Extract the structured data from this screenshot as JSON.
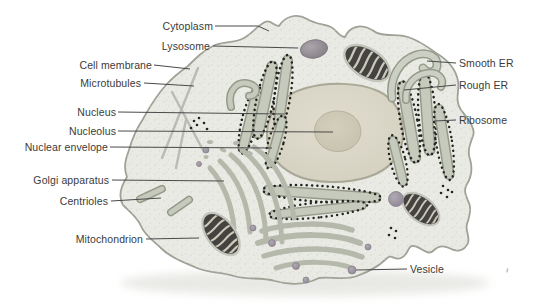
{
  "diagram": {
    "labels": {
      "cytoplasm": "Cytoplasm",
      "lysosome": "Lysosome",
      "cell_membrane": "Cell membrane",
      "microtubules": "Microtubules",
      "nucleus": "Nucleus",
      "nucleolus": "Nucleolus",
      "nuclear_envelope": "Nuclear envelope",
      "golgi_apparatus": "Golgi apparatus",
      "centrioles": "Centrioles",
      "mitochondrion": "Mitochondrion",
      "smooth_er": "Smooth ER",
      "rough_er": "Rough ER",
      "ribosome": "Ribosome",
      "vesicle": "Vesicle"
    },
    "colors": {
      "background": "#ffffff",
      "cytoplasm_fill": "#eaeae4",
      "membrane_stroke": "#9fa096",
      "nucleus_fill": "#dbd8c9",
      "nucleolus_fill": "#ccc8b4",
      "er_fill": "#c6cabd",
      "er_stroke": "#949a89",
      "golgi_fill": "#b5b9ab",
      "mitochondrion_body": "#44433f",
      "mitochondrion_cristae": "#ccc9ba",
      "lysosome_fill": "#948e96",
      "vesicle_fill": "#a09aa4",
      "ribosome_dot": "#222420",
      "label_text": "#3b3b3b",
      "label_line": "#4a4a4a"
    }
  }
}
